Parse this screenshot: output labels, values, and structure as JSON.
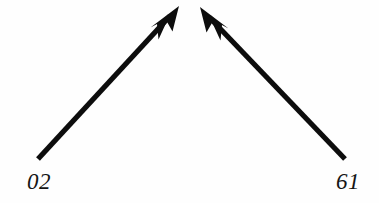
{
  "diagram": {
    "type": "two-converging-arrows",
    "background_color": "#fefefe",
    "stroke_color": "#0d0d0d",
    "labels": {
      "left": "02",
      "right": "61"
    },
    "arrows": [
      {
        "name": "left-arrow",
        "direction": "up-right",
        "tail": {
          "x": 38,
          "y": 159
        },
        "tip": {
          "x": 179,
          "y": 6
        },
        "shaft_width": 5,
        "arrowhead": "barbed"
      },
      {
        "name": "right-arrow",
        "direction": "up-left",
        "tail": {
          "x": 345,
          "y": 159
        },
        "tip": {
          "x": 200,
          "y": 7
        },
        "shaft_width": 5,
        "arrowhead": "barbed"
      }
    ]
  }
}
